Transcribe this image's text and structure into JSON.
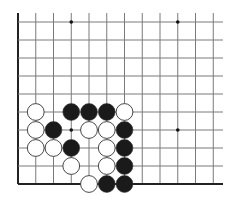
{
  "board": {
    "description": "Go problem diagram, lower-left corner region",
    "edges": [
      "left",
      "bottom"
    ],
    "columns": 12,
    "rows": 10,
    "origin_x": 18,
    "origin_y": 22,
    "spacing_x": 17.75,
    "spacing_y": 18,
    "line_color": "#7a7a7a",
    "edge_color": "#222222",
    "star_points": [
      {
        "col": 3,
        "row": 0
      },
      {
        "col": 9,
        "row": 0
      },
      {
        "col": 3,
        "row": 6
      },
      {
        "col": 9,
        "row": 6
      }
    ],
    "stones": [
      {
        "color": "white",
        "col": 1,
        "row": 5
      },
      {
        "color": "black",
        "col": 3,
        "row": 5
      },
      {
        "color": "black",
        "col": 4,
        "row": 5
      },
      {
        "color": "black",
        "col": 5,
        "row": 5
      },
      {
        "color": "white",
        "col": 6,
        "row": 5
      },
      {
        "color": "white",
        "col": 1,
        "row": 6
      },
      {
        "color": "black",
        "col": 2,
        "row": 6
      },
      {
        "color": "white",
        "col": 4,
        "row": 6
      },
      {
        "color": "white",
        "col": 5,
        "row": 6
      },
      {
        "color": "black",
        "col": 6,
        "row": 6
      },
      {
        "color": "white",
        "col": 1,
        "row": 7
      },
      {
        "color": "white",
        "col": 2,
        "row": 7
      },
      {
        "color": "black",
        "col": 3,
        "row": 7
      },
      {
        "color": "white",
        "col": 5,
        "row": 7
      },
      {
        "color": "black",
        "col": 6,
        "row": 7
      },
      {
        "color": "white",
        "col": 3,
        "row": 8
      },
      {
        "color": "white",
        "col": 5,
        "row": 8
      },
      {
        "color": "black",
        "col": 6,
        "row": 8
      },
      {
        "color": "white",
        "col": 4,
        "row": 9
      },
      {
        "color": "black",
        "col": 5,
        "row": 9
      },
      {
        "color": "black",
        "col": 6,
        "row": 9
      }
    ],
    "stone_colors": {
      "black": "#1a1a1a",
      "white": "#ffffff",
      "outline": "#333333"
    }
  }
}
